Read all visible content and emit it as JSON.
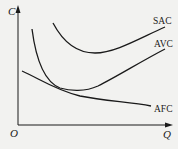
{
  "diagram": {
    "type": "cost-curves",
    "axes": {
      "y_label": "C",
      "x_label": "Q",
      "origin_label": "O"
    },
    "curves": [
      {
        "name": "SAC",
        "label": "SAC"
      },
      {
        "name": "AVC",
        "label": "AVC"
      },
      {
        "name": "AFC",
        "label": "AFC"
      }
    ],
    "colors": {
      "background": "#f2f2f0",
      "ink": "#1a1a1a"
    }
  }
}
